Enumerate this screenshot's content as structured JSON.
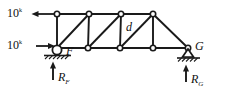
{
  "figure": {
    "type": "truss-free-body-diagram",
    "stroke_color": "#1a1a1a",
    "node_fill": "#ffffff"
  },
  "loads": [
    {
      "id": "load-top",
      "value": "10",
      "unit_sup": "k",
      "direction": "left",
      "applied_at": "top-left-node"
    },
    {
      "id": "load-bottom",
      "value": "10",
      "unit_sup": "k",
      "direction": "right",
      "applied_at": "F"
    }
  ],
  "labels": {
    "member_d": "d",
    "node_F": "F",
    "node_G": "G",
    "reaction_F": "R",
    "reaction_F_sub": "F",
    "reaction_G": "R",
    "reaction_G_sub": "G"
  },
  "supports": [
    {
      "id": "support-F",
      "kind": "roller",
      "at": "F"
    },
    {
      "id": "support-G",
      "kind": "pin",
      "at": "G"
    }
  ],
  "geometry": {
    "top_nodes": [
      [
        57,
        14
      ],
      [
        89,
        14
      ],
      [
        121,
        14
      ],
      [
        153,
        14
      ]
    ],
    "bottom_nodes": [
      [
        57,
        48
      ],
      [
        88,
        48
      ],
      [
        120,
        48
      ],
      [
        153,
        48
      ],
      [
        188,
        48
      ]
    ],
    "top_chord": [
      [
        57,
        14,
        153,
        14
      ]
    ],
    "bottom_chord": [
      [
        57,
        48,
        188,
        48
      ]
    ],
    "verticals": [
      [
        57,
        14,
        57,
        48
      ],
      [
        89,
        14,
        88,
        48
      ],
      [
        121,
        14,
        120,
        48
      ],
      [
        153,
        14,
        153,
        48
      ]
    ],
    "diagonals": [
      [
        57,
        48,
        89,
        14
      ],
      [
        88,
        48,
        121,
        14
      ],
      [
        120,
        48,
        153,
        14
      ],
      [
        153,
        14,
        188,
        48
      ]
    ]
  }
}
